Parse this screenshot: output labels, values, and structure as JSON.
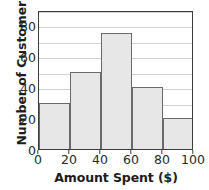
{
  "chart_data": {
    "type": "bar",
    "title": "",
    "subtitle": "",
    "xlabel": "Amount Spent ($)",
    "ylabel": "Number of Customers",
    "categories": [
      "0-20",
      "20-40",
      "40-60",
      "60-80",
      "80-100"
    ],
    "bin_edges": [
      0,
      20,
      40,
      60,
      80,
      100
    ],
    "values": [
      30,
      50,
      75,
      40,
      20
    ],
    "xlim": [
      0,
      100
    ],
    "ylim": [
      0,
      90
    ],
    "x_tick_labels": [
      "0",
      "20",
      "40",
      "60",
      "80",
      "100"
    ],
    "x_tick_values": [
      0,
      20,
      40,
      60,
      80,
      100
    ],
    "y_tick_labels": [
      "0",
      "20",
      "40",
      "60",
      "80"
    ],
    "y_tick_values": [
      0,
      20,
      40,
      60,
      80
    ],
    "gridlines": {
      "horizontal": true,
      "vertical": false,
      "horizontal_values": [
        10,
        20,
        30,
        40,
        50,
        60,
        70,
        80,
        90
      ],
      "spacing": 10
    },
    "legend": null,
    "legend_position": "none",
    "annotations": [],
    "colors": {
      "bar_fill": "#e7e7e7",
      "bar_border": "#6a6a6a",
      "frame": "#3d3d3d",
      "gridline": "#d2d2d2",
      "text": "#1c1c1c",
      "tick_text": "#2a2a2a",
      "background": "#ffffff"
    }
  }
}
